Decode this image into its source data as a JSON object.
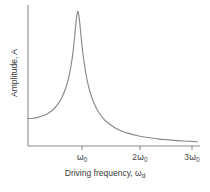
{
  "chart_data": {
    "type": "line",
    "title": "",
    "xlabel": "Driving frequency, ωd",
    "ylabel": "Amplitude, A",
    "xlabel_base": "Driving frequency, ω",
    "xlabel_sub": "d",
    "xtick_labels": [
      "ω₀",
      "2ω₀",
      "3ω₀"
    ],
    "xticks": [
      {
        "base": "ω",
        "sub": "0",
        "prefix": "",
        "x_px": 82
      },
      {
        "base": "ω",
        "sub": "0",
        "prefix": "2",
        "x_px": 140
      },
      {
        "base": "ω",
        "sub": "0",
        "prefix": "3",
        "x_px": 192
      }
    ],
    "ytick_labels": [],
    "grid": false,
    "legend": false,
    "xlim": [
      0,
      3.45
    ],
    "ylim": [
      0,
      1.0
    ],
    "x": [
      0.0,
      0.1,
      0.2,
      0.3,
      0.4,
      0.5,
      0.6,
      0.65,
      0.7,
      0.75,
      0.8,
      0.84,
      0.88,
      0.9,
      0.92,
      0.94,
      0.96,
      0.97,
      0.98,
      0.99,
      1.0,
      1.01,
      1.02,
      1.03,
      1.04,
      1.06,
      1.08,
      1.1,
      1.12,
      1.16,
      1.2,
      1.25,
      1.3,
      1.4,
      1.5,
      1.6,
      1.75,
      1.9,
      2.0,
      2.2,
      2.4,
      2.6,
      2.8,
      3.0,
      3.2,
      3.4
    ],
    "y": [
      0.195,
      0.197,
      0.203,
      0.214,
      0.231,
      0.257,
      0.297,
      0.325,
      0.36,
      0.404,
      0.462,
      0.524,
      0.607,
      0.66,
      0.722,
      0.793,
      0.866,
      0.9,
      0.928,
      0.948,
      0.955,
      0.948,
      0.928,
      0.9,
      0.866,
      0.793,
      0.722,
      0.66,
      0.607,
      0.516,
      0.444,
      0.377,
      0.325,
      0.25,
      0.2,
      0.165,
      0.128,
      0.103,
      0.091,
      0.073,
      0.06,
      0.051,
      0.044,
      0.038,
      0.034,
      0.03
    ],
    "colors": {
      "curve": "#8a8a8a",
      "axis": "#8c8c8c",
      "text": "#3a3a3a"
    },
    "axes_px": {
      "left": 28,
      "right": 200,
      "top": 5,
      "bottom": 146
    }
  }
}
